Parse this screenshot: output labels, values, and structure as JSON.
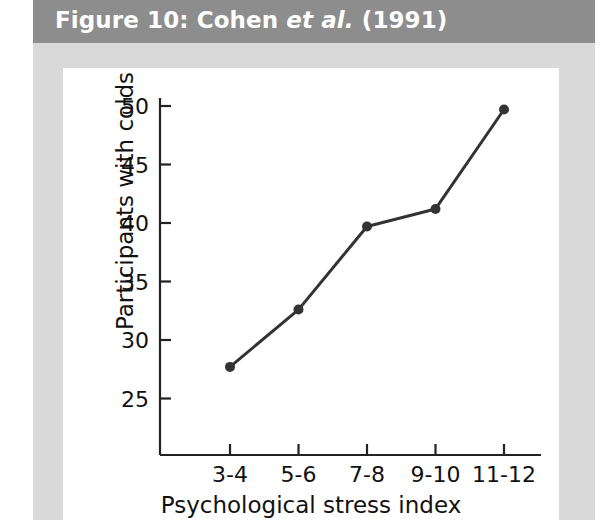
{
  "figure": {
    "caption_prefix": "Figure 10: Cohen ",
    "caption_italic": "et al.",
    "caption_suffix": " (1991)",
    "caption_full": "Figure 10: Cohen et al. (1991)",
    "caption_bar_color": "#8d8d8d",
    "caption_text_color": "#ffffff",
    "page_margin_color": "#d9d9d9",
    "panel_color": "#ffffff"
  },
  "chart_data": {
    "type": "line",
    "title": "",
    "categories": [
      "3-4",
      "5-6",
      "7-8",
      "9-10",
      "11-12"
    ],
    "values": [
      27.7,
      32.6,
      39.7,
      41.2,
      49.7
    ],
    "series": [
      {
        "name": "Participants with colds",
        "values": [
          27.7,
          32.6,
          39.7,
          41.2,
          49.7
        ]
      }
    ],
    "xlabel": "Psychological stress index",
    "ylabel": "Participants with colds",
    "yticks": [
      50,
      45,
      40,
      35,
      30,
      25
    ],
    "ytick_labels": [
      "50",
      "45",
      "40",
      "35",
      "30",
      "25"
    ],
    "xtick_labels": [
      "3-4",
      "5-6",
      "7-8",
      "9-10",
      "11-12"
    ],
    "ylim": [
      22.5,
      51.5
    ],
    "grid": false,
    "legend": false,
    "line_color": "#333333",
    "marker_color": "#333333",
    "marker": "circle",
    "axis_color": "#222222"
  }
}
